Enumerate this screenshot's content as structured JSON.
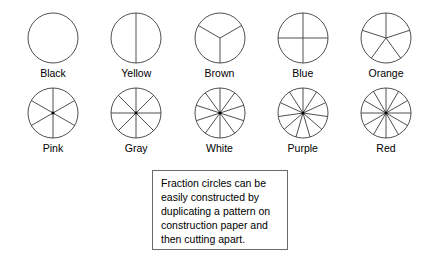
{
  "sheet": {
    "title": "Fraction circles chart",
    "background_color": "#ffffff",
    "line_color": "#3c3c3c",
    "text_color": "#000000"
  },
  "rows": [
    {
      "name": "row-1",
      "circles": [
        {
          "label": "Black",
          "sections": 1,
          "start_angle": 0
        },
        {
          "label": "Yellow",
          "sections": 2,
          "start_angle": 0
        },
        {
          "label": "Brown",
          "sections": 3,
          "start_angle": 180
        },
        {
          "label": "Blue",
          "sections": 4,
          "start_angle": 0
        },
        {
          "label": "Orange",
          "sections": 5,
          "start_angle": 0
        }
      ]
    },
    {
      "name": "row-2",
      "circles": [
        {
          "label": "Pink",
          "sections": 6,
          "start_angle": 0
        },
        {
          "label": "Gray",
          "sections": 8,
          "start_angle": 0
        },
        {
          "label": "White",
          "sections": 10,
          "start_angle": 0
        },
        {
          "label": "Purple",
          "sections": 11,
          "start_angle": 0
        },
        {
          "label": "Red",
          "sections": 12,
          "start_angle": 0
        }
      ]
    }
  ],
  "note": {
    "lines": [
      "Fraction circles can be",
      "easily constructed by",
      "duplicating a pattern on",
      "construction paper and",
      "then cutting apart."
    ],
    "border_color": "#6b6b6b"
  }
}
